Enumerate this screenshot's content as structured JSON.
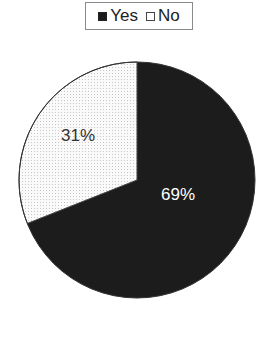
{
  "chart_data": {
    "type": "pie",
    "title": "",
    "categories": [
      "Yes",
      "No"
    ],
    "values": [
      69,
      31
    ],
    "labels": [
      "69%",
      "31%"
    ],
    "colors": [
      "#1c1c1c",
      "#f4f4f4"
    ],
    "legend_position": "top"
  },
  "legend": {
    "items": [
      {
        "label": "Yes",
        "color": "#1c1c1c"
      },
      {
        "label": "No",
        "color": "#ffffff"
      }
    ]
  },
  "slices": {
    "yes_label": "69%",
    "no_label": "31%"
  }
}
